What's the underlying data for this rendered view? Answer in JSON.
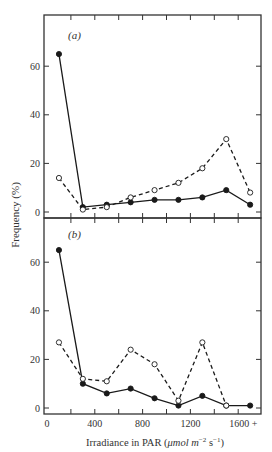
{
  "chart_data": [
    {
      "type": "line",
      "panel_label": "(a)",
      "x": [
        100,
        300,
        500,
        700,
        900,
        1100,
        1300,
        1500,
        1700
      ],
      "series": [
        {
          "name": "filled circles (solid line)",
          "marker": "filled",
          "line": "solid",
          "values": [
            65,
            2,
            3,
            4,
            5,
            5,
            6,
            9,
            3
          ]
        },
        {
          "name": "open circles (dashed line)",
          "marker": "open",
          "line": "dashed",
          "values": [
            14,
            1,
            2,
            6,
            9,
            12,
            18,
            30,
            8
          ]
        }
      ],
      "ylim": [
        0,
        75
      ],
      "yticks": [
        0,
        20,
        40,
        60
      ],
      "xlim": [
        0,
        1780
      ],
      "grid": false
    },
    {
      "type": "line",
      "panel_label": "(b)",
      "x": [
        100,
        300,
        500,
        700,
        900,
        1100,
        1300,
        1500,
        1700
      ],
      "series": [
        {
          "name": "filled circles (solid line)",
          "marker": "filled",
          "line": "solid",
          "values": [
            65,
            10,
            6,
            8,
            4,
            1,
            5,
            1,
            1
          ]
        },
        {
          "name": "open circles (dashed line)",
          "marker": "open",
          "line": "dashed",
          "values": [
            27,
            12,
            11,
            24,
            18,
            3,
            27,
            1,
            null
          ]
        }
      ],
      "ylim": [
        0,
        75
      ],
      "yticks": [
        0,
        20,
        40,
        60
      ],
      "xticks": [
        0,
        400,
        800,
        1200,
        1600
      ],
      "xtick_labels": [
        "0",
        "400",
        "800",
        "1200",
        "1600 +"
      ],
      "xlim": [
        0,
        1780
      ],
      "grid": false
    }
  ],
  "labels": {
    "ylabel": "Frequency  (%)",
    "xlabel_main": "Irradiance in PAR  (",
    "xlabel_unit": "μmol m",
    "xlabel_exp1": "−2",
    "xlabel_s": " s",
    "xlabel_exp2": "−1",
    "xlabel_close": ")",
    "panel_a": "(a)",
    "panel_b": "(b)",
    "ytick_labels": [
      "0",
      "20",
      "40",
      "60"
    ],
    "xtick_labels": [
      "0",
      "400",
      "800",
      "1200",
      "1600 +"
    ]
  },
  "colors": {
    "ink": "#1a1a1a",
    "axis": "#333333",
    "background": "#ffffff"
  }
}
